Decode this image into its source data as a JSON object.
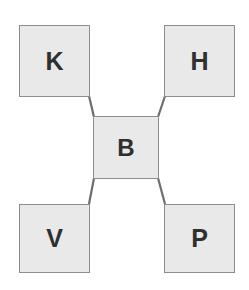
{
  "diagram": {
    "type": "node-link-diagram",
    "title": "",
    "background_color": "#ffffff",
    "node_fill_color": "#e9e9e9",
    "node_border_color": "#8d8d8d",
    "label_color": "#2f2f2f",
    "edge_color": "#6e6e6e",
    "nodes": [
      {
        "id": "K",
        "label": "K",
        "role": "top-left",
        "x": 19,
        "y": 25,
        "width": 71,
        "height": 72
      },
      {
        "id": "H",
        "label": "H",
        "role": "top-right",
        "x": 164,
        "y": 25,
        "width": 71,
        "height": 72
      },
      {
        "id": "B",
        "label": "B",
        "role": "center",
        "x": 93,
        "y": 116,
        "width": 66,
        "height": 63
      },
      {
        "id": "V",
        "label": "V",
        "role": "bottom-left",
        "x": 19,
        "y": 204,
        "width": 71,
        "height": 69
      },
      {
        "id": "P",
        "label": "P",
        "role": "bottom-right",
        "x": 164,
        "y": 204,
        "width": 71,
        "height": 69
      }
    ],
    "edges": [
      {
        "from": "K",
        "to": "B",
        "x1": 89,
        "y1": 96,
        "x2": 94,
        "y2": 117
      },
      {
        "from": "H",
        "to": "B",
        "x1": 165,
        "y1": 96,
        "x2": 158,
        "y2": 117
      },
      {
        "from": "V",
        "to": "B",
        "x1": 89,
        "y1": 204,
        "x2": 94,
        "y2": 178
      },
      {
        "from": "P",
        "to": "B",
        "x1": 165,
        "y1": 204,
        "x2": 158,
        "y2": 178
      }
    ]
  }
}
